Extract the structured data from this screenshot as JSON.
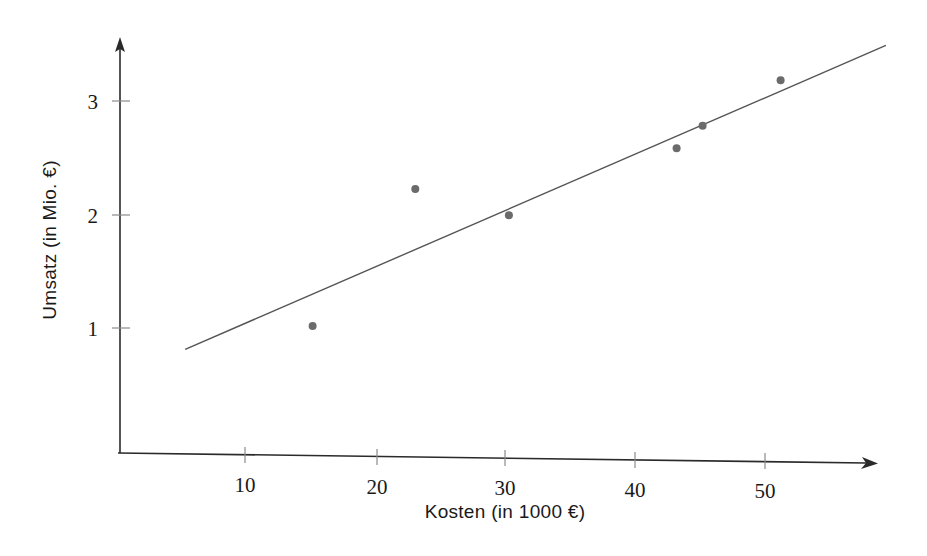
{
  "chart_data": {
    "type": "scatter",
    "title": "",
    "xlabel": "Kosten (in 1000 €)",
    "ylabel": "Umsatz (in Mio. €)",
    "xlim": [
      0,
      58.5
    ],
    "ylim": [
      0,
      3.65
    ],
    "grid": false,
    "legend": null,
    "xticks": [
      10,
      20,
      30,
      40,
      50
    ],
    "xtick_labels": [
      "10",
      "20",
      "30",
      "40",
      "50"
    ],
    "yticks": [
      1,
      2,
      3
    ],
    "ytick_labels": [
      "1",
      "2",
      "3"
    ],
    "point_color": "#6b6b6b",
    "line_color": "#555555",
    "axis_color": "#2a2a2a",
    "background": "#ffffff",
    "series": [
      {
        "name": "Messpunkte",
        "type": "scatter",
        "marker": "circle",
        "x": [
          15.2,
          23.1,
          30.3,
          43.2,
          45.2,
          51.2
        ],
        "y": [
          1.04,
          2.26,
          2.04,
          2.65,
          2.85,
          3.26
        ]
      },
      {
        "name": "Regressionsgerade",
        "type": "line",
        "x": [
          5.4,
          59.3
        ],
        "y": [
          0.82,
          3.58
        ]
      }
    ]
  },
  "axes": {
    "x_label": "Kosten (in 1000 €)",
    "y_label": "Umsatz (in Mio. €)",
    "x_tick_values": [
      "10",
      "20",
      "30",
      "40",
      "50"
    ],
    "y_tick_values": [
      "1",
      "2",
      "3"
    ]
  }
}
